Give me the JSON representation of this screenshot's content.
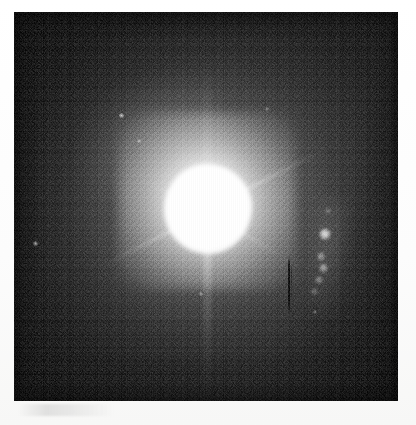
{
  "image": {
    "kind": "astronomical-observation",
    "title": "Optical image of a bright unresolved nucleus with a one-sided knotty jet",
    "modality": "grayscale broad-band imaging (scanned print)",
    "orientation_note": "north up, east left (assumed standard)",
    "background_level": "dark mottled sky with visible photographic grain",
    "paper": {
      "background_color": "#fcfcfc",
      "left_margin_px": 14,
      "top_margin_px": 12,
      "right_margin_px": 18,
      "bottom_margin_px": 24
    },
    "frame": {
      "x": 14,
      "y": 12,
      "width": 384,
      "height": 389,
      "sky_color": "#1a1a1a",
      "core_color": "#ffffff"
    }
  },
  "features": {
    "nucleus": {
      "label": "saturated central source",
      "center_x": 193,
      "center_y": 198,
      "core_radius_px": 44,
      "halo_radius_px": 165,
      "peak_color": "#ffffff",
      "description": "over-exposed point-like core surrounded by a smooth circular halo"
    },
    "diffraction_spikes": [
      {
        "name": "spike-northeast",
        "angle_deg": -27,
        "length_px": 135,
        "intensity": 0.7
      },
      {
        "name": "spike-southwest",
        "angle_deg": 153,
        "length_px": 118,
        "intensity": 0.55
      },
      {
        "name": "spike-southeast",
        "angle_deg": 31,
        "length_px": 96,
        "intensity": 0.45
      },
      {
        "name": "spike-northwest",
        "angle_deg": 205,
        "length_px": 74,
        "intensity": 0.32
      },
      {
        "name": "bleed-column-south",
        "angle_deg": 90,
        "length_px": 170,
        "intensity": 0.4
      },
      {
        "name": "bleed-column-north",
        "angle_deg": 270,
        "length_px": 150,
        "intensity": 0.28
      }
    ],
    "jet_knots": [
      {
        "name": "knot-A",
        "x": 311,
        "y": 222,
        "size_px": 12,
        "brightness": 1.0
      },
      {
        "name": "knot-B",
        "x": 306,
        "y": 244,
        "size_px": 7,
        "brightness": 0.52
      },
      {
        "name": "knot-C",
        "x": 309,
        "y": 256,
        "size_px": 8,
        "brightness": 0.6
      },
      {
        "name": "knot-D",
        "x": 304,
        "y": 268,
        "size_px": 7,
        "brightness": 0.48
      },
      {
        "name": "knot-E",
        "x": 300,
        "y": 280,
        "size_px": 6,
        "brightness": 0.38
      },
      {
        "name": "knot-F",
        "x": 313,
        "y": 199,
        "size_px": 5,
        "brightness": 0.3
      }
    ],
    "field_stars": [
      {
        "name": "field-star-1",
        "x": 107,
        "y": 103,
        "size_px": 4
      },
      {
        "name": "field-star-2",
        "x": 124,
        "y": 128,
        "size_px": 3
      },
      {
        "name": "field-star-3",
        "x": 21,
        "y": 231,
        "size_px": 4
      },
      {
        "name": "field-star-4",
        "x": 186,
        "y": 281,
        "size_px": 3
      },
      {
        "name": "field-star-5",
        "x": 300,
        "y": 299,
        "size_px": 3
      },
      {
        "name": "field-star-6",
        "x": 252,
        "y": 96,
        "size_px": 3
      }
    ],
    "artifacts": [
      {
        "name": "dark-column-defect",
        "x": 274,
        "y": 244,
        "width_px": 2,
        "height_px": 58,
        "description": "thin dark vertical detector column"
      },
      {
        "name": "paper-smudge-right-margin",
        "x": 372,
        "y": 300,
        "description": "faint pencil-like mark in the white print margin"
      },
      {
        "name": "paper-smudge-bottom-margin",
        "x": 18,
        "y": 404,
        "description": "faint grey streak along the lower margin"
      }
    ],
    "nebulosity": {
      "name": "extended-fuzz-northwest",
      "x": 62,
      "y": 70,
      "width_px": 150,
      "height_px": 110,
      "description": "low surface-brightness extension to the upper-left of the nucleus"
    }
  }
}
